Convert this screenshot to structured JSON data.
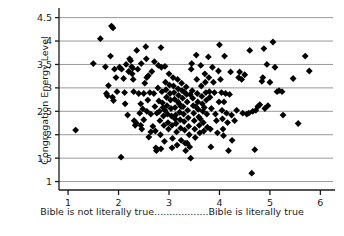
{
  "chart_data": {
    "type": "scatter",
    "title": "",
    "subtitle": "",
    "xlabel": "Bible is not literally true..................Bible is literally true",
    "ylabel": "Congregation Energy Level",
    "xlim": [
      0.82,
      6.25
    ],
    "ylim": [
      0.82,
      4.62
    ],
    "xticks": [
      1,
      2,
      3,
      4,
      5,
      6
    ],
    "xtick_labels": [
      "1",
      "2",
      "3",
      "4",
      "5",
      "6"
    ],
    "yticks": [
      1,
      1.5,
      2,
      2.5,
      3,
      3.5,
      4,
      4.5
    ],
    "ytick_labels": [
      "1",
      "1.5",
      "2",
      "2.5",
      "3",
      "3.5",
      "4",
      "4.5"
    ],
    "grid": "horizontal",
    "grid_color": "#999999",
    "legend": "none",
    "marker": "diamond",
    "marker_color": "#000000",
    "marker_size": 5,
    "n_points": 232,
    "points": [
      [
        1.15,
        2.1
      ],
      [
        1.5,
        3.52
      ],
      [
        1.64,
        4.05
      ],
      [
        1.74,
        3.45
      ],
      [
        1.76,
        2.88
      ],
      [
        1.78,
        2.83
      ],
      [
        1.8,
        3.05
      ],
      [
        1.84,
        3.68
      ],
      [
        1.86,
        4.32
      ],
      [
        1.89,
        4.28
      ],
      [
        1.88,
        2.8
      ],
      [
        1.9,
        2.73
      ],
      [
        1.92,
        3.4
      ],
      [
        1.95,
        3.22
      ],
      [
        1.97,
        2.92
      ],
      [
        2.02,
        3.44
      ],
      [
        2.05,
        1.52
      ],
      [
        2.06,
        3.4
      ],
      [
        2.1,
        3.2
      ],
      [
        2.12,
        2.9
      ],
      [
        2.15,
        3.5
      ],
      [
        2.18,
        2.42
      ],
      [
        2.2,
        3.35
      ],
      [
        2.22,
        3.62
      ],
      [
        2.24,
        3.58
      ],
      [
        2.26,
        3.45
      ],
      [
        2.28,
        3.42
      ],
      [
        2.29,
        3.18
      ],
      [
        2.3,
        2.92
      ],
      [
        2.31,
        2.3
      ],
      [
        2.33,
        2.2
      ],
      [
        2.35,
        2.25
      ],
      [
        2.36,
        3.8
      ],
      [
        2.38,
        3.4
      ],
      [
        2.4,
        2.88
      ],
      [
        2.42,
        2.46
      ],
      [
        2.44,
        2.2
      ],
      [
        2.45,
        3.52
      ],
      [
        2.46,
        2.12
      ],
      [
        2.48,
        2.55
      ],
      [
        2.5,
        2.88
      ],
      [
        2.52,
        3.1
      ],
      [
        2.54,
        3.88
      ],
      [
        2.55,
        3.62
      ],
      [
        2.56,
        3.22
      ],
      [
        2.58,
        2.74
      ],
      [
        2.6,
        1.95
      ],
      [
        2.62,
        2.9
      ],
      [
        2.64,
        2.44
      ],
      [
        2.66,
        3.35
      ],
      [
        2.68,
        2.18
      ],
      [
        2.7,
        2.88
      ],
      [
        2.72,
        2.6
      ],
      [
        2.73,
        2.08
      ],
      [
        2.74,
        1.72
      ],
      [
        2.75,
        1.66
      ],
      [
        2.76,
        2.46
      ],
      [
        2.78,
        3.0
      ],
      [
        2.79,
        3.48
      ],
      [
        2.8,
        2.72
      ],
      [
        2.81,
        2.5
      ],
      [
        2.82,
        2.3
      ],
      [
        2.83,
        2.0
      ],
      [
        2.84,
        3.86
      ],
      [
        2.85,
        3.44
      ],
      [
        2.86,
        2.92
      ],
      [
        2.87,
        2.68
      ],
      [
        2.88,
        2.58
      ],
      [
        2.89,
        2.4
      ],
      [
        2.9,
        2.2
      ],
      [
        2.91,
        1.86
      ],
      [
        2.92,
        3.46
      ],
      [
        2.93,
        3.12
      ],
      [
        2.94,
        2.96
      ],
      [
        2.95,
        2.8
      ],
      [
        2.96,
        2.62
      ],
      [
        2.97,
        2.44
      ],
      [
        2.98,
        2.26
      ],
      [
        2.99,
        2.12
      ],
      [
        3.0,
        3.3
      ],
      [
        3.01,
        3.06
      ],
      [
        3.02,
        2.88
      ],
      [
        3.03,
        2.74
      ],
      [
        3.04,
        2.56
      ],
      [
        3.05,
        2.4
      ],
      [
        3.06,
        2.2
      ],
      [
        3.07,
        1.92
      ],
      [
        3.08,
        3.22
      ],
      [
        3.09,
        3.04
      ],
      [
        3.1,
        2.9
      ],
      [
        3.11,
        2.76
      ],
      [
        3.12,
        2.58
      ],
      [
        3.13,
        2.42
      ],
      [
        3.14,
        2.24
      ],
      [
        3.15,
        2.06
      ],
      [
        3.16,
        1.78
      ],
      [
        3.17,
        3.18
      ],
      [
        3.18,
        2.98
      ],
      [
        3.19,
        2.84
      ],
      [
        3.2,
        2.66
      ],
      [
        3.21,
        2.48
      ],
      [
        3.22,
        2.32
      ],
      [
        3.23,
        2.14
      ],
      [
        3.24,
        1.88
      ],
      [
        3.25,
        3.1
      ],
      [
        3.26,
        2.94
      ],
      [
        3.27,
        2.78
      ],
      [
        3.28,
        2.6
      ],
      [
        3.29,
        2.44
      ],
      [
        3.3,
        2.28
      ],
      [
        3.31,
        2.1
      ],
      [
        3.32,
        1.82
      ],
      [
        3.33,
        1.66
      ],
      [
        3.34,
        3.02
      ],
      [
        3.35,
        2.86
      ],
      [
        3.36,
        2.7
      ],
      [
        3.37,
        2.52
      ],
      [
        3.38,
        2.36
      ],
      [
        3.39,
        2.18
      ],
      [
        3.4,
        2.0
      ],
      [
        3.41,
        1.74
      ],
      [
        3.43,
        1.5
      ],
      [
        3.44,
        3.4
      ],
      [
        3.45,
        3.52
      ],
      [
        3.46,
        2.94
      ],
      [
        3.47,
        2.78
      ],
      [
        3.48,
        2.62
      ],
      [
        3.49,
        2.46
      ],
      [
        3.5,
        2.3
      ],
      [
        3.51,
        2.12
      ],
      [
        3.52,
        1.94
      ],
      [
        3.54,
        3.7
      ],
      [
        3.55,
        3.18
      ],
      [
        3.56,
        2.88
      ],
      [
        3.57,
        2.7
      ],
      [
        3.58,
        2.54
      ],
      [
        3.59,
        2.38
      ],
      [
        3.6,
        2.2
      ],
      [
        3.61,
        2.04
      ],
      [
        3.63,
        3.48
      ],
      [
        3.64,
        3.04
      ],
      [
        3.65,
        2.82
      ],
      [
        3.66,
        2.66
      ],
      [
        3.67,
        2.5
      ],
      [
        3.68,
        2.26
      ],
      [
        3.69,
        2.08
      ],
      [
        3.71,
        3.3
      ],
      [
        3.72,
        3.12
      ],
      [
        3.73,
        2.9
      ],
      [
        3.74,
        2.74
      ],
      [
        3.75,
        2.44
      ],
      [
        3.76,
        2.16
      ],
      [
        3.78,
        3.66
      ],
      [
        3.79,
        3.22
      ],
      [
        3.8,
        2.92
      ],
      [
        3.81,
        2.8
      ],
      [
        3.82,
        2.12
      ],
      [
        3.83,
        1.74
      ],
      [
        3.86,
        3.44
      ],
      [
        3.88,
        3.12
      ],
      [
        3.9,
        2.9
      ],
      [
        3.92,
        2.44
      ],
      [
        3.94,
        2.3
      ],
      [
        3.96,
        2.04
      ],
      [
        3.98,
        3.36
      ],
      [
        4.0,
        3.92
      ],
      [
        4.02,
        3.18
      ],
      [
        4.04,
        2.9
      ],
      [
        4.05,
        2.52
      ],
      [
        4.06,
        2.34
      ],
      [
        4.07,
        2.12
      ],
      [
        4.08,
        1.98
      ],
      [
        4.1,
        3.68
      ],
      [
        4.12,
        2.88
      ],
      [
        4.14,
        2.46
      ],
      [
        4.16,
        2.26
      ],
      [
        4.18,
        1.66
      ],
      [
        4.22,
        3.34
      ],
      [
        4.24,
        2.42
      ],
      [
        4.25,
        1.88
      ],
      [
        4.3,
        2.3
      ],
      [
        4.34,
        2.52
      ],
      [
        4.38,
        3.22
      ],
      [
        4.4,
        3.34
      ],
      [
        4.44,
        3.18
      ],
      [
        4.46,
        2.46
      ],
      [
        4.5,
        3.28
      ],
      [
        4.54,
        2.44
      ],
      [
        4.58,
        2.46
      ],
      [
        4.6,
        3.8
      ],
      [
        4.64,
        1.18
      ],
      [
        4.66,
        2.5
      ],
      [
        4.7,
        1.68
      ],
      [
        4.72,
        2.52
      ],
      [
        4.76,
        2.6
      ],
      [
        4.8,
        2.64
      ],
      [
        4.84,
        3.14
      ],
      [
        4.86,
        3.22
      ],
      [
        4.88,
        3.84
      ],
      [
        4.9,
        2.56
      ],
      [
        4.94,
        3.5
      ],
      [
        4.96,
        2.62
      ],
      [
        5.0,
        3.12
      ],
      [
        5.06,
        3.98
      ],
      [
        5.1,
        3.44
      ],
      [
        5.14,
        2.92
      ],
      [
        5.18,
        2.94
      ],
      [
        5.24,
        2.92
      ],
      [
        5.26,
        2.42
      ],
      [
        5.46,
        3.2
      ],
      [
        5.56,
        2.24
      ],
      [
        5.7,
        3.68
      ],
      [
        5.78,
        3.36
      ],
      [
        2.13,
        2.66
      ],
      [
        2.27,
        3.3
      ],
      [
        2.59,
        3.26
      ],
      [
        2.71,
        3.56
      ],
      [
        3.42,
        2.86
      ],
      [
        3.53,
        2.6
      ],
      [
        3.62,
        2.34
      ],
      [
        3.7,
        2.58
      ],
      [
        3.84,
        2.56
      ],
      [
        3.99,
        2.7
      ],
      [
        4.09,
        2.7
      ],
      [
        4.2,
        2.86
      ],
      [
        2.44,
        2.66
      ],
      [
        2.64,
        2.06
      ],
      [
        2.84,
        1.7
      ],
      [
        3.06,
        1.72
      ],
      [
        3.24,
        2.6
      ],
      [
        3.36,
        1.82
      ],
      [
        2.92,
        2.52
      ],
      [
        3.12,
        2.34
      ],
      [
        3.18,
        2.7
      ],
      [
        3.3,
        2.92
      ],
      [
        2.5,
        2.32
      ],
      [
        2.56,
        2.5
      ]
    ]
  }
}
